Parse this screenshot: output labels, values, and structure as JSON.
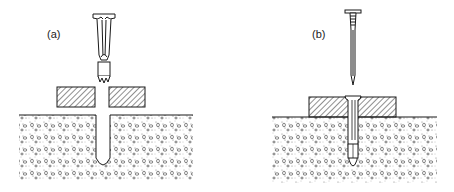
{
  "figure": {
    "panels": [
      {
        "id": "a",
        "label": "(a)",
        "description": "plug anchor being inserted through fixture into drilled hole in concrete"
      },
      {
        "id": "b",
        "label": "(b)",
        "description": "nail driven into installed plug anchor, expanding it in the hole"
      }
    ],
    "colors": {
      "line": "#1a1a1a",
      "fill": "#ffffff",
      "concrete_stipple": "#555555"
    }
  }
}
